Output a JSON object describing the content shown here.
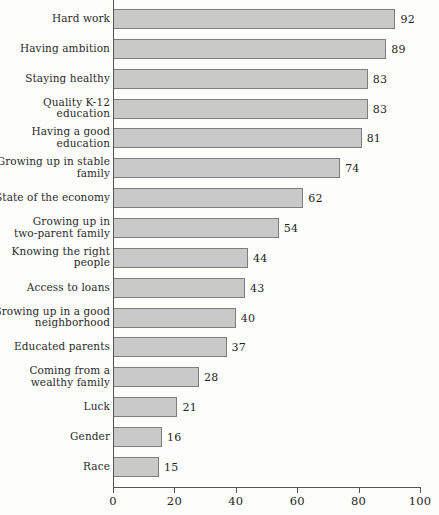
{
  "chart_data": {
    "type": "bar",
    "orientation": "horizontal",
    "title": "",
    "subtitle": "",
    "xlabel": "",
    "ylabel": "",
    "xlim": [
      0,
      100
    ],
    "xticks": [
      0,
      20,
      40,
      60,
      80,
      100
    ],
    "xtick_labels": [
      "0",
      "20",
      "40",
      "60",
      "80",
      "100"
    ],
    "grid": false,
    "legend": false,
    "bar_fill_color": "#c9c9c9",
    "bar_border_color": "#7d7d7d",
    "axis_color": "#555555",
    "background_color": "#fdfdfc",
    "categories": [
      "Hard work",
      "Having ambition",
      "Staying healthy",
      "Quality K-12\neducation",
      "Having a good\neducation",
      "Growing up in stable\nfamily",
      "State of the economy",
      "Growing up in\ntwo-parent family",
      "Knowing the right\npeople",
      "Access to loans",
      "Growing up in a good\nneighborhood",
      "Educated parents",
      "Coming from a\nwealthy family",
      "Luck",
      "Gender",
      "Race"
    ],
    "values": [
      92,
      89,
      83,
      83,
      81,
      74,
      62,
      54,
      44,
      43,
      40,
      37,
      28,
      21,
      16,
      15
    ],
    "value_labels": [
      "92",
      "89",
      "83",
      "83",
      "81",
      "74",
      "62",
      "54",
      "44",
      "43",
      "40",
      "37",
      "28",
      "21",
      "16",
      "15"
    ]
  }
}
